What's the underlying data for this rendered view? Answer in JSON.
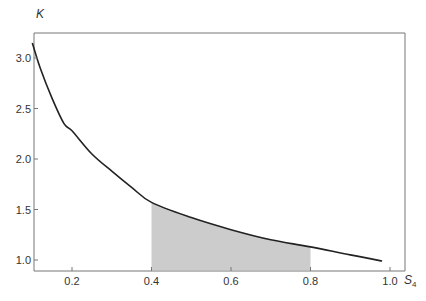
{
  "chart_data": {
    "type": "line",
    "title": "",
    "xlabel": "S",
    "xlabel_subscript": "4",
    "ylabel": "K",
    "xlim": [
      0.1,
      1.04
    ],
    "ylim": [
      0.89,
      3.25
    ],
    "grid": false,
    "legend": null,
    "x_ticks": [
      0.2,
      0.4,
      0.6,
      0.8,
      1.0
    ],
    "x_tick_labels": [
      "0.2",
      "0.4",
      "0.6",
      "0.8",
      "1.0"
    ],
    "y_ticks": [
      1.0,
      1.5,
      2.0,
      2.5,
      3.0
    ],
    "y_tick_labels": [
      "1.0",
      "1.5",
      "2.0",
      "2.5",
      "3.0"
    ],
    "series": [
      {
        "name": "K(S4)",
        "x": [
          0.1,
          0.12,
          0.15,
          0.18,
          0.2,
          0.25,
          0.3,
          0.35,
          0.4,
          0.5,
          0.6,
          0.7,
          0.8,
          0.9,
          0.98
        ],
        "values": [
          3.15,
          2.9,
          2.6,
          2.35,
          2.28,
          2.05,
          1.88,
          1.72,
          1.57,
          1.42,
          1.3,
          1.2,
          1.13,
          1.05,
          0.99
        ]
      }
    ],
    "shaded_region": {
      "x_start": 0.4,
      "x_end": 0.8,
      "under": "K(S4)",
      "color": "#cccccc"
    },
    "colors": {
      "line": "#222222",
      "axis": "#777777",
      "shade": "#cccccc",
      "text": "#333333"
    }
  }
}
